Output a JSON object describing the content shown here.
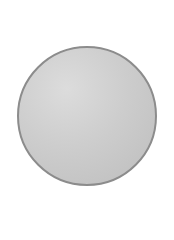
{
  "shape": {
    "type": "circle",
    "fill_color": "#c8c8c8",
    "border_color": "#8c8c8c"
  }
}
